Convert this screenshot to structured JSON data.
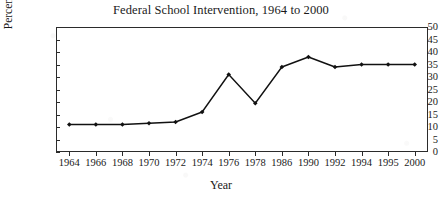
{
  "chart_data": {
    "type": "line",
    "title": "Federal School Intervention, 1964 to 2000",
    "xlabel": "Year",
    "ylabel": "Percentage",
    "categories": [
      "1964",
      "1966",
      "1968",
      "1970",
      "1972",
      "1974",
      "1976",
      "1978",
      "1986",
      "1990",
      "1992",
      "1994",
      "1995",
      "2000"
    ],
    "values": [
      11,
      11,
      11,
      11.5,
      12,
      16,
      31,
      19.5,
      34,
      38,
      34,
      35,
      35,
      35
    ],
    "ylim": [
      0,
      50
    ],
    "yticks": [
      0,
      5,
      10,
      15,
      20,
      25,
      30,
      35,
      40,
      45,
      50
    ],
    "ytick_labels": [
      "0",
      "5",
      "10",
      "15",
      "20",
      "25",
      "30",
      "35",
      "40",
      "45",
      "50"
    ],
    "grid": false,
    "legend": false,
    "marker": "diamond",
    "line_color": "#111111",
    "marker_color": "#111111",
    "axis_color": "#2b2b2b",
    "background": "#ffffff"
  }
}
